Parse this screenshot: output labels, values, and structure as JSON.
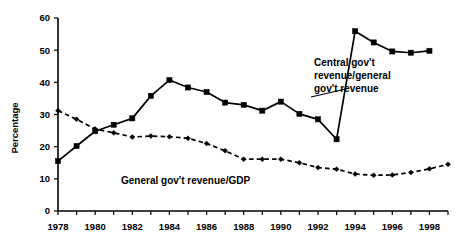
{
  "chart_data": {
    "type": "line",
    "title": "",
    "xlabel": "",
    "ylabel": "Percentage",
    "xlim": [
      1978,
      1999
    ],
    "ylim": [
      0,
      60
    ],
    "ytick_values": [
      0,
      10,
      20,
      30,
      40,
      50,
      60
    ],
    "ytick_labels": [
      "0",
      "10",
      "20",
      "30",
      "40",
      "50",
      "60"
    ],
    "xtick_values": [
      1978,
      1979,
      1980,
      1981,
      1982,
      1983,
      1984,
      1985,
      1986,
      1987,
      1988,
      1989,
      1990,
      1991,
      1992,
      1993,
      1994,
      1995,
      1996,
      1997,
      1998,
      1999
    ],
    "xtick_labels": [
      "1978",
      "",
      "1980",
      "",
      "1982",
      "",
      "1984",
      "",
      "1986",
      "",
      "1988",
      "",
      "1990",
      "",
      "1992",
      "",
      "1994",
      "",
      "1996",
      "",
      "1998",
      ""
    ],
    "grid": false,
    "legend_position": "inline-annotations",
    "series": [
      {
        "name": "Central gov't revenue/general gov't revenue",
        "style": "solid",
        "marker": "square",
        "x": [
          1978,
          1979,
          1980,
          1981,
          1982,
          1983,
          1984,
          1985,
          1986,
          1987,
          1988,
          1989,
          1990,
          1991,
          1992,
          1993,
          1994,
          1995,
          1996,
          1997,
          1998
        ],
        "values": [
          15.5,
          20.2,
          24.8,
          26.8,
          28.8,
          35.8,
          40.7,
          38.4,
          37.0,
          33.7,
          33.0,
          31.2,
          34.0,
          30.2,
          28.5,
          22.3,
          55.9,
          52.4,
          49.6,
          49.2,
          49.8
        ]
      },
      {
        "name": "General gov't revenue/GDP",
        "style": "dashed",
        "marker": "diamond",
        "x": [
          1978,
          1979,
          1980,
          1981,
          1982,
          1983,
          1984,
          1985,
          1986,
          1987,
          1988,
          1989,
          1990,
          1991,
          1992,
          1993,
          1994,
          1995,
          1996,
          1997,
          1998,
          1999
        ],
        "values": [
          31.2,
          28.5,
          25.5,
          24.3,
          23.0,
          23.3,
          23.1,
          22.6,
          21.0,
          18.7,
          16.1,
          16.1,
          16.1,
          15.0,
          13.5,
          13.0,
          11.5,
          11.1,
          11.2,
          12.0,
          13.1,
          14.5
        ]
      }
    ],
    "annotations": [
      {
        "id": "central-gov-annotation",
        "lines": [
          "Central gov't",
          "revenue/general",
          "gov't revenue"
        ],
        "text": "Central gov't revenue/general gov't revenue"
      },
      {
        "id": "general-gov-annotation",
        "lines": [
          "General gov't revenue/GDP"
        ],
        "text": "General gov't revenue/GDP"
      }
    ],
    "colors": {
      "series": "#000000",
      "axis": "#000000",
      "background": "#ffffff"
    }
  }
}
